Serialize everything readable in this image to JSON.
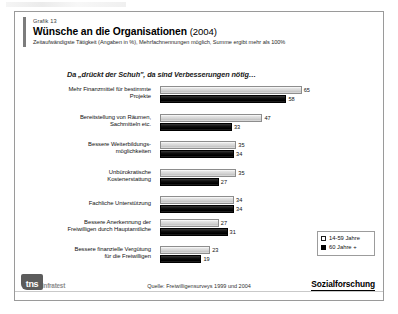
{
  "header": {
    "graphic_no": "Grafik 13",
    "title": "Wünsche an die Organisationen",
    "year": "(2004)",
    "subtitle": "Zeitaufwändigste Tätigkeit (Angaben in %), Mehrfachnennungen möglich, Summe ergibt mehr als 100%"
  },
  "intro": "Da „drückt der Schuh\", da sind Verbesserungen nötig…",
  "legend": {
    "items": [
      {
        "label": "14-59 Jahre",
        "swatch": "light"
      },
      {
        "label": "60 Jahre +",
        "swatch": "dark"
      }
    ]
  },
  "footer": {
    "logo_mark": "tns",
    "logo_word": "infratest",
    "source": "Quelle: Freiwilligensurveys 1999 und 2004",
    "brand": "Sozialforschung"
  },
  "chart_data": {
    "type": "bar",
    "orientation": "horizontal",
    "title": "Wünsche an die Organisationen (2004)",
    "subtitle": "Zeitaufwändigste Tätigkeit (Angaben in %), Mehrfachnennungen möglich, Summe ergibt mehr als 100%",
    "xlabel": "",
    "ylabel": "",
    "xlim": [
      0,
      65
    ],
    "grid": false,
    "legend_position": "bottom-right",
    "categories": [
      "Mehr Finanzmittel für bestimmte Projekte",
      "Bereitstellung von Räumen, Sachmitteln etc.",
      "Bessere Weiterbildungs-möglichkeiten",
      "Unbürokratische Kostenerstattung",
      "Fachliche Unterstützung",
      "Bessere Anerkennung der Freiwilligen durch Hauptamtliche",
      "Bessere finanzielle Vergütung für die Freiwilligen"
    ],
    "categories_lines": [
      [
        "Mehr Finanzmittel für bestimmte",
        "Projekte"
      ],
      [
        "Bereitstellung von Räumen,",
        "Sachmitteln etc."
      ],
      [
        "Bessere Weiterbildungs-",
        "möglichkeiten"
      ],
      [
        "Unbürokratische",
        "Kostenerstattung"
      ],
      [
        "Fachliche Unterstützung"
      ],
      [
        "Bessere Anerkennung der",
        "Freiwilligen durch Hauptamtliche"
      ],
      [
        "Bessere finanzielle Vergütung",
        "für die Freiwilligen"
      ]
    ],
    "series": [
      {
        "name": "14-59 Jahre",
        "color": "#d3d3d3",
        "values": [
          65,
          47,
          35,
          35,
          34,
          27,
          23
        ]
      },
      {
        "name": "60 Jahre +",
        "color": "#000000",
        "values": [
          58,
          33,
          34,
          27,
          34,
          31,
          19
        ]
      }
    ]
  }
}
